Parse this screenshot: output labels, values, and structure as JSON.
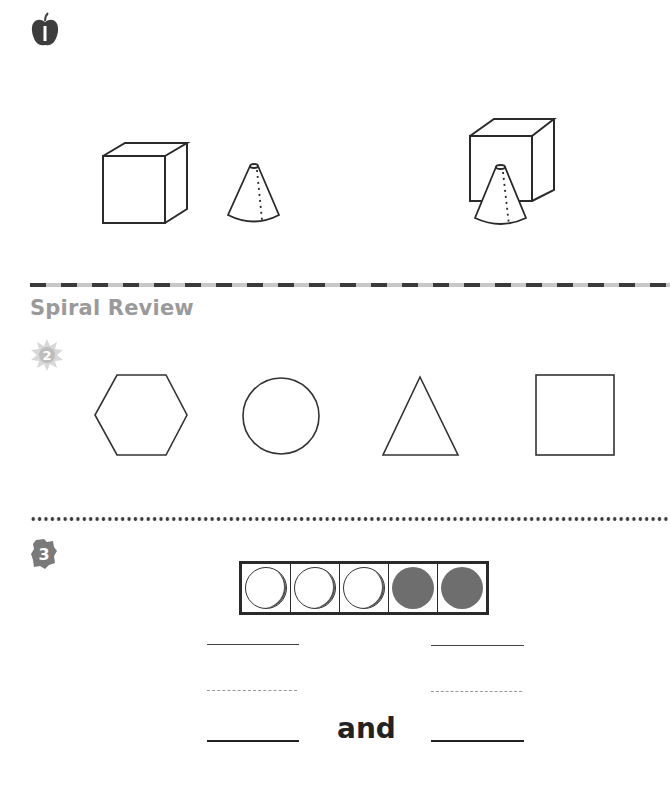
{
  "problems": [
    {
      "number": "1",
      "badge_icon": "apple-icon",
      "badge_color": "#3d3d3d",
      "left_figures": [
        "cube",
        "cone"
      ],
      "right_figures": [
        "cube-behind-cone"
      ]
    },
    {
      "number": "2",
      "badge_icon": "sun-icon",
      "badge_color": "#c9c9c9",
      "shapes": [
        "hexagon",
        "circle",
        "triangle",
        "square"
      ]
    },
    {
      "number": "3",
      "badge_icon": "leaf-icon",
      "badge_color": "#7a7a7a",
      "five_frame": {
        "counters": [
          "empty",
          "empty",
          "empty",
          "filled",
          "filled"
        ]
      },
      "connector_word": "and"
    }
  ],
  "section": {
    "title": "Spiral Review"
  },
  "colors": {
    "ink": "#2a2a2a",
    "section_title": "#9a9a9a",
    "filled_counter": "#6e6e6e"
  }
}
